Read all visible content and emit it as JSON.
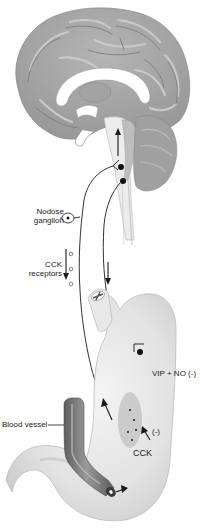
{
  "diagram": {
    "type": "anatomical-illustration",
    "structures": [
      {
        "name": "brain",
        "kind": "organ"
      },
      {
        "name": "brainstem",
        "kind": "organ"
      },
      {
        "name": "cerebellum",
        "kind": "organ"
      },
      {
        "name": "nodose-ganglion",
        "kind": "ganglion"
      },
      {
        "name": "stomach",
        "kind": "organ"
      },
      {
        "name": "esophagus",
        "kind": "organ"
      },
      {
        "name": "duodenum",
        "kind": "organ"
      },
      {
        "name": "blood-vessel",
        "kind": "vessel"
      }
    ],
    "labels": {
      "nodose_ganglion": "Nodose\nganglion",
      "nodose_line1": "Nodose",
      "nodose_line2": "ganglion",
      "cck_receptors_line1": "CCK",
      "cck_receptors_line2": "receptors",
      "vip_no": "VIP + NO (-)",
      "blood_vessel": "Blood vessel",
      "cck": "CCK",
      "inhibit": "(-)"
    },
    "arrows": [
      {
        "from": "stomach",
        "to": "brainstem",
        "meaning": "afferent signal (upward arrow in brainstem)"
      },
      {
        "from": "brainstem",
        "to": "stomach",
        "meaning": "efferent signal (downward arrow)"
      },
      {
        "from": "nodose-ganglion",
        "to": "CCK receptors",
        "meaning": "receptor transport (downward arrow)"
      },
      {
        "from": "blood-vessel",
        "to": "duodenum",
        "meaning": "CCK release into blood"
      },
      {
        "from": "CCK",
        "to": "vagal-afferent-terminals",
        "meaning": "CCK acts on afferent endings (-)"
      }
    ],
    "colors": {
      "brain": "#a9a9a9",
      "brain_highlight": "#c8c8c8",
      "brain_dark": "#8a8a8a",
      "stomach": "#e4e4e4",
      "stomach_shade": "#cfcfcf",
      "vessel": "#7d7d7d",
      "vessel_dark": "#5a5a5a",
      "nerve": "#1a1a1a",
      "mucosa_patch": "#c4c4c4"
    }
  }
}
